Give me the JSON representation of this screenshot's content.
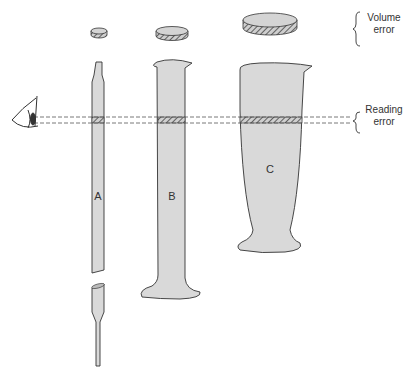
{
  "diagram": {
    "vessels": [
      {
        "id": "A",
        "label": "A",
        "type": "pipette"
      },
      {
        "id": "B",
        "label": "B",
        "type": "graduated cylinder"
      },
      {
        "id": "C",
        "label": "C",
        "type": "conical measure"
      }
    ],
    "annotations": {
      "volume_error": {
        "line1": "Volume",
        "line2": "error"
      },
      "reading_error": {
        "line1": "Reading",
        "line2": "error"
      }
    },
    "icons": [
      "eye-icon"
    ],
    "colors": {
      "fill": "#d9d9d9",
      "stroke": "#333333",
      "hatch": "#555555",
      "background": "#ffffff"
    }
  }
}
